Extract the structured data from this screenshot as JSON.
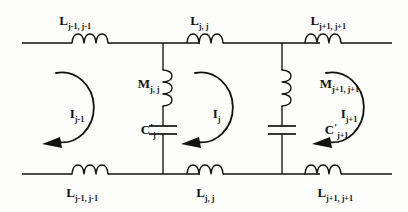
{
  "diagram": {
    "type": "electrical-schematic",
    "line_color": "#111111",
    "background_color": "#fdfdfc",
    "top_inductors": [
      {
        "symbol": "L",
        "subscript": "j-1, j-1",
        "x": 85,
        "y": 43
      },
      {
        "symbol": "L",
        "subscript": "j, j",
        "x": 205,
        "y": 43
      },
      {
        "symbol": "L",
        "subscript": "j+1, j+1",
        "x": 340,
        "y": 43
      }
    ],
    "bottom_inductors": [
      {
        "symbol": "L",
        "subscript": "j-1, j-1",
        "x": 85,
        "y": 174
      },
      {
        "symbol": "L",
        "subscript": "j, j",
        "x": 205,
        "y": 174
      },
      {
        "symbol": "L",
        "subscript": "j+1, j+1",
        "x": 340,
        "y": 174
      }
    ],
    "shunt_inductors": [
      {
        "symbol": "M",
        "subscript": "j, j",
        "x": 145,
        "y": 85
      },
      {
        "symbol": "M",
        "subscript": "j+1, j+1",
        "x": 265,
        "y": 85
      }
    ],
    "capacitors": [
      {
        "symbol": "C",
        "prime": "'",
        "subscript": "j",
        "x": 145,
        "y": 130
      },
      {
        "symbol": "C",
        "prime": "'",
        "subscript": "j+1",
        "x": 265,
        "y": 130
      }
    ],
    "mesh_currents": [
      {
        "symbol": "I",
        "subscript": "j-1",
        "x": 60,
        "y": 112,
        "direction": "clockwise"
      },
      {
        "symbol": "I",
        "subscript": "j",
        "x": 200,
        "y": 112,
        "direction": "clockwise"
      },
      {
        "symbol": "I",
        "subscript": "j+1",
        "x": 330,
        "y": 112,
        "direction": "clockwise"
      }
    ],
    "labels": {
      "L_top_left": "L",
      "L_top_left_sub": "j-1, j-1",
      "L_top_mid": "L",
      "L_top_mid_sub": "j, j",
      "L_top_right": "L",
      "L_top_right_sub": "j+1, j+1",
      "L_bot_left": "L",
      "L_bot_left_sub": "j-1, j-1",
      "L_bot_mid": "L",
      "L_bot_mid_sub": "j, j",
      "L_bot_right": "L",
      "L_bot_right_sub": "j+1, j+1",
      "M_left": "M",
      "M_left_sub": "j, j",
      "M_right": "M",
      "M_right_sub": "j+1, j+1",
      "C_left": "C",
      "C_left_prime": "'",
      "C_left_sub": "j",
      "C_right": "C",
      "C_right_prime": "'",
      "C_right_sub": "j+1",
      "I_left": "I",
      "I_left_sub": "j-1",
      "I_mid": "I",
      "I_mid_sub": "j",
      "I_right": "I",
      "I_right_sub": "j+1"
    }
  }
}
